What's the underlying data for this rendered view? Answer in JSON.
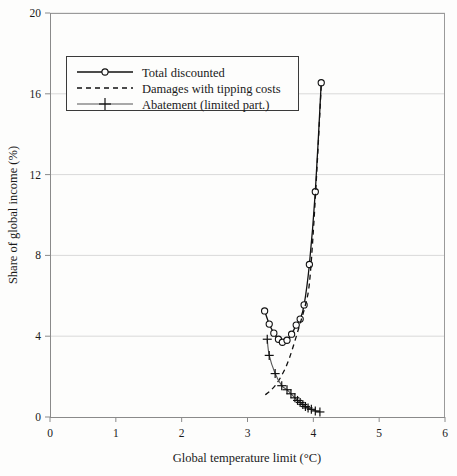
{
  "chart_data": {
    "type": "line",
    "title": "",
    "xlabel": "Global temperature limit (°C)",
    "ylabel": "Share of global income (%)",
    "xlim": [
      0,
      6
    ],
    "ylim": [
      0,
      20
    ],
    "xticks": [
      0,
      1,
      2,
      3,
      4,
      5,
      6
    ],
    "yticks": [
      0,
      4,
      8,
      12,
      16,
      20
    ],
    "xtick_labels": [
      "0",
      "1",
      "2",
      "3",
      "4",
      "5",
      "6"
    ],
    "ytick_labels": [
      "0",
      "4",
      "8",
      "12",
      "16",
      "20"
    ],
    "grid": "horizontal",
    "legend_position": "upper-left",
    "series": [
      {
        "name": "Total discounted",
        "marker": "circle",
        "linestyle": "solid",
        "points": [
          [
            3.26,
            5.25
          ],
          [
            3.33,
            4.6
          ],
          [
            3.4,
            4.15
          ],
          [
            3.47,
            3.85
          ],
          [
            3.53,
            3.7
          ],
          [
            3.6,
            3.8
          ],
          [
            3.67,
            4.1
          ],
          [
            3.74,
            4.55
          ],
          [
            3.8,
            4.85
          ],
          [
            3.86,
            5.55
          ],
          [
            3.94,
            7.55
          ],
          [
            4.03,
            11.15
          ],
          [
            4.12,
            16.55
          ]
        ]
      },
      {
        "name": "Damages with tipping costs",
        "marker": "none",
        "linestyle": "dashed",
        "points": [
          [
            3.27,
            1.1
          ],
          [
            3.34,
            1.28
          ],
          [
            3.42,
            1.55
          ],
          [
            3.5,
            1.95
          ],
          [
            3.58,
            2.45
          ],
          [
            3.64,
            2.95
          ],
          [
            3.7,
            3.55
          ],
          [
            3.76,
            4.2
          ],
          [
            3.82,
            4.85
          ],
          [
            3.88,
            5.55
          ],
          [
            3.94,
            6.6
          ],
          [
            4.0,
            9.2
          ],
          [
            4.06,
            12.6
          ],
          [
            4.12,
            16.4
          ]
        ]
      },
      {
        "name": "Abatement (limited part.)",
        "marker": "plus",
        "linestyle": "solid",
        "points": [
          [
            3.3,
            3.85
          ],
          [
            3.33,
            3.05
          ],
          [
            3.42,
            2.15
          ],
          [
            3.52,
            1.55
          ],
          [
            3.6,
            1.35
          ],
          [
            3.66,
            1.15
          ],
          [
            3.72,
            0.95
          ],
          [
            3.76,
            0.82
          ],
          [
            3.8,
            0.72
          ],
          [
            3.84,
            0.62
          ],
          [
            3.88,
            0.52
          ],
          [
            3.92,
            0.45
          ],
          [
            3.97,
            0.38
          ],
          [
            4.03,
            0.3
          ],
          [
            4.1,
            0.25
          ]
        ]
      }
    ]
  },
  "legend": {
    "entries": [
      {
        "label": "Total discounted",
        "icon": "line-with-circle-marker"
      },
      {
        "label": "Damages with tipping costs",
        "icon": "dashed-line"
      },
      {
        "label": "Abatement (limited part.)",
        "icon": "line-with-plus-marker"
      }
    ]
  },
  "colors": {
    "background": "#fdfdfc",
    "axis": "#8a8a8a",
    "grid": "#d9d9d9",
    "series_total": "#111111",
    "series_damages": "#111111",
    "series_abatement": "#555555",
    "text": "#1a1a1a"
  }
}
